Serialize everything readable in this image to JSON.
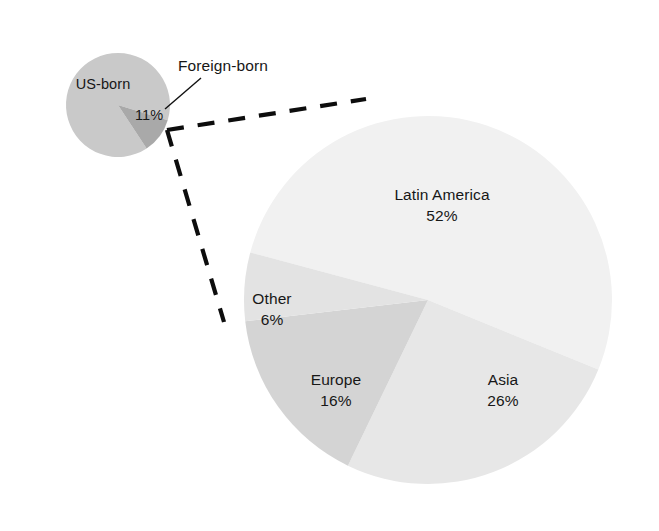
{
  "small_pie": {
    "name": "us-population-pie",
    "slices": [
      {
        "key": "us_born",
        "label": "US-born",
        "value": 89,
        "value_text": "",
        "color": "#c9c9c9"
      },
      {
        "key": "foreign_born",
        "label": "Foreign-born",
        "value": 11,
        "value_text": "11%",
        "color": "#a9a9a9"
      }
    ],
    "inside_label": "US-born",
    "wedge_value_label": "11%",
    "callout_label": "Foreign-born"
  },
  "large_pie": {
    "name": "foreign-born-origin-pie",
    "slices": [
      {
        "key": "latin_america",
        "label": "Latin America",
        "value": 52,
        "value_text": "52%",
        "color": "#f1f1f1"
      },
      {
        "key": "asia",
        "label": "Asia",
        "value": 26,
        "value_text": "26%",
        "color": "#e7e7e7"
      },
      {
        "key": "europe",
        "label": "Europe",
        "value": 16,
        "value_text": "16%",
        "color": "#d4d4d4"
      },
      {
        "key": "other",
        "label": "Other",
        "value": 6,
        "value_text": "6%",
        "color": "#e3e3e3"
      }
    ]
  },
  "chart_data": {
    "type": "pie",
    "title": "",
    "subtitle": "",
    "charts": [
      {
        "name": "US population by nativity",
        "type": "pie",
        "categories": [
          "US-born",
          "Foreign-born"
        ],
        "values": [
          89,
          11
        ],
        "labels_shown": [
          "US-born",
          "11%"
        ],
        "units": "percent",
        "colors": [
          "#c9c9c9",
          "#a9a9a9"
        ],
        "annotations": [
          "Foreign-born"
        ],
        "legend": "none",
        "note": "Only the Foreign-born slice is labeled with its value (11%). The US-born slice shows its name only."
      },
      {
        "name": "Foreign-born population by region of birth",
        "type": "pie",
        "categories": [
          "Latin America",
          "Asia",
          "Europe",
          "Other"
        ],
        "values": [
          52,
          26,
          16,
          6
        ],
        "labels_shown": [
          "Latin America 52%",
          "Asia 26%",
          "Europe 16%",
          "Other 6%"
        ],
        "units": "percent",
        "colors": [
          "#f1f1f1",
          "#e7e7e7",
          "#d4d4d4",
          "#e3e3e3"
        ],
        "legend": "none",
        "note": "Exploded detail of the 11% Foreign-born slice, connected by dashed leader lines."
      }
    ],
    "grid": false,
    "legend_position": "none"
  }
}
